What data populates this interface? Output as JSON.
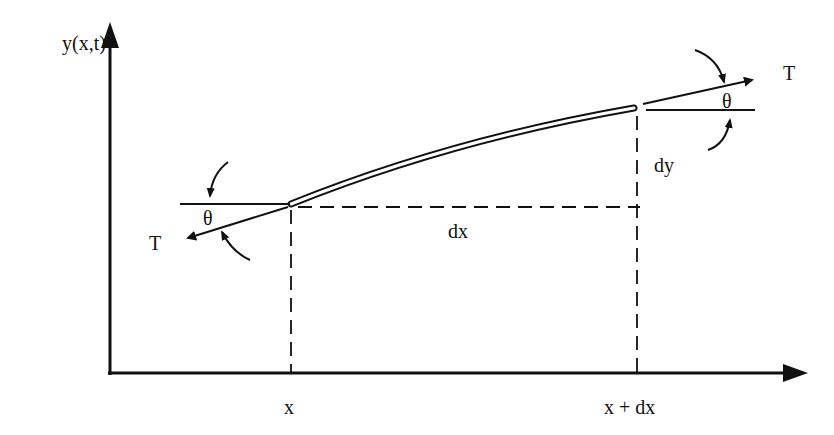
{
  "diagram": {
    "labels": {
      "y_axis": "y(x,t)",
      "x_left": "x",
      "x_right": "x + dx",
      "dx": "dx",
      "dy": "dy",
      "tension_left": "T",
      "tension_right": "T",
      "theta_left": "θ",
      "theta_right": "θ"
    },
    "colors": {
      "ink": "#111111",
      "background": "#ffffff"
    }
  }
}
